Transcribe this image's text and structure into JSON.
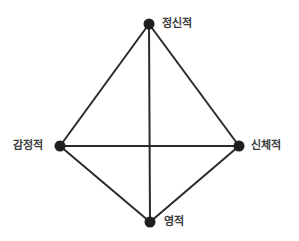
{
  "diagram": {
    "title": "",
    "background_color": "#ffffff",
    "edge_color": "#2b2b2b",
    "node_color": "#1f1f1f",
    "label_color": "#3b3b3b",
    "edge_width": 2,
    "node_radius": 5.5,
    "nodes": [
      {
        "id": "mental",
        "label": "정신적",
        "x": 149,
        "y": 24,
        "label_side": "right"
      },
      {
        "id": "emotional",
        "label": "감정적",
        "x": 60,
        "y": 146,
        "label_side": "left"
      },
      {
        "id": "physical",
        "label": "신체적",
        "x": 239,
        "y": 146,
        "label_side": "right"
      },
      {
        "id": "spiritual",
        "label": "영적",
        "x": 150,
        "y": 222,
        "label_side": "right"
      }
    ],
    "edges": [
      {
        "from": "mental",
        "to": "emotional",
        "kind": "perimeter"
      },
      {
        "from": "mental",
        "to": "physical",
        "kind": "perimeter"
      },
      {
        "from": "emotional",
        "to": "spiritual",
        "kind": "perimeter"
      },
      {
        "from": "physical",
        "to": "spiritual",
        "kind": "perimeter"
      },
      {
        "from": "mental",
        "to": "spiritual",
        "kind": "diagonal"
      },
      {
        "from": "emotional",
        "to": "physical",
        "kind": "diagonal"
      }
    ]
  }
}
